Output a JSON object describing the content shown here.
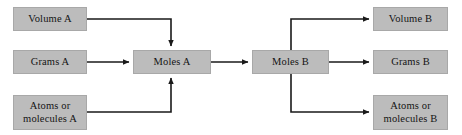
{
  "diagram": {
    "type": "flowchart",
    "canvas": {
      "width": 462,
      "height": 135
    },
    "style": {
      "node_fill": "#bcbcbc",
      "node_border": "#a8a8a8",
      "edge_color": "#1a1a1a",
      "background": "#ffffff"
    },
    "nodes": [
      {
        "id": "volume_a",
        "label": "Volume A",
        "x": 13,
        "y": 7,
        "w": 74,
        "h": 24
      },
      {
        "id": "grams_a",
        "label": "Grams A",
        "x": 13,
        "y": 50,
        "w": 74,
        "h": 24
      },
      {
        "id": "atoms_a",
        "label": "Atoms or\nmolecules A",
        "x": 13,
        "y": 95,
        "w": 74,
        "h": 35
      },
      {
        "id": "moles_a",
        "label": "Moles A",
        "x": 133,
        "y": 50,
        "w": 78,
        "h": 24
      },
      {
        "id": "moles_b",
        "label": "Moles B",
        "x": 252,
        "y": 50,
        "w": 77,
        "h": 24
      },
      {
        "id": "volume_b",
        "label": "Volume B",
        "x": 373,
        "y": 7,
        "w": 75,
        "h": 24
      },
      {
        "id": "grams_b",
        "label": "Grams B",
        "x": 373,
        "y": 50,
        "w": 75,
        "h": 24
      },
      {
        "id": "atoms_b",
        "label": "Atoms or\nmolecules B",
        "x": 373,
        "y": 95,
        "w": 75,
        "h": 35
      }
    ],
    "edges": [
      {
        "id": "volume-a-to-moles-a",
        "from": "volume_a",
        "to": "moles_a",
        "path": "M 87 19 L 171 19 L 171 46",
        "arrow": "down"
      },
      {
        "id": "grams-a-to-moles-a",
        "from": "grams_a",
        "to": "moles_a",
        "path": "M 87 62 L 129 62",
        "arrow": "right"
      },
      {
        "id": "atoms-a-to-moles-a",
        "from": "atoms_a",
        "to": "moles_a",
        "path": "M 87 112 L 171 112 L 171 78",
        "arrow": "up"
      },
      {
        "id": "moles-a-to-moles-b",
        "from": "moles_a",
        "to": "moles_b",
        "path": "M 211 62 L 248 62",
        "arrow": "right"
      },
      {
        "id": "moles-b-to-volume-b",
        "from": "moles_b",
        "to": "volume_b",
        "path": "M 291 50 L 291 19 L 369 19",
        "arrow": "right"
      },
      {
        "id": "moles-b-to-grams-b",
        "from": "moles_b",
        "to": "grams_b",
        "path": "M 329 62 L 369 62",
        "arrow": "right"
      },
      {
        "id": "moles-b-to-atoms-b",
        "from": "moles_b",
        "to": "atoms_b",
        "path": "M 291 74 L 291 112 L 369 112",
        "arrow": "right"
      }
    ]
  }
}
